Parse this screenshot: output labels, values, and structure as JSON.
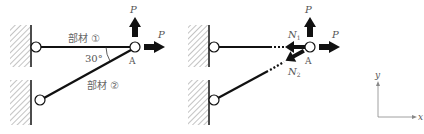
{
  "figure": {
    "left": {
      "member1_label": "部材 ①",
      "member2_label": "部材 ②",
      "angle_label": "30°",
      "node_label": "A",
      "load_up_label": "P",
      "load_right_label": "P"
    },
    "right": {
      "n1_label": "N",
      "n1_sub": "1",
      "n2_label": "N",
      "n2_sub": "2",
      "node_label": "A",
      "load_up_label": "P",
      "load_right_label": "P"
    },
    "axes": {
      "x_label": "x",
      "y_label": "y"
    }
  },
  "colors": {
    "line": "#111111",
    "hatch": "#777777",
    "text": "#555555",
    "axis": "#888888"
  }
}
